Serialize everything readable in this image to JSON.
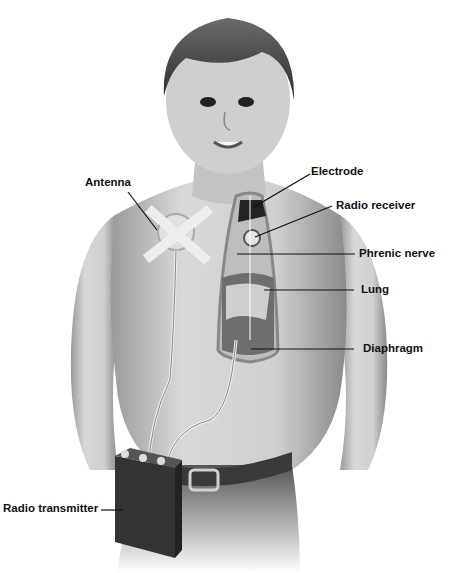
{
  "diagram": {
    "labels": {
      "antenna": "Antenna",
      "electrode": "Electrode",
      "radio_receiver": "Radio receiver",
      "phrenic_nerve": "Phrenic nerve",
      "lung": "Lung",
      "diaphragm": "Diaphragm",
      "radio_transmitter": "Radio transmitter"
    }
  }
}
